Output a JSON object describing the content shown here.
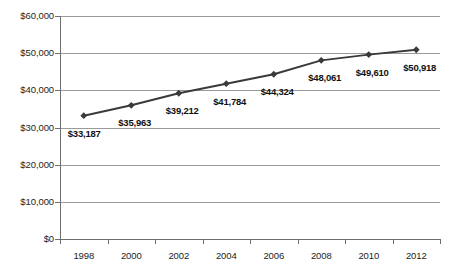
{
  "chart_data": {
    "type": "line",
    "title": "",
    "subtitle": "",
    "xlabel": "",
    "ylabel": "",
    "categories": [
      "1998",
      "2000",
      "2002",
      "2004",
      "2006",
      "2008",
      "2010",
      "2012"
    ],
    "values": [
      33187,
      35963,
      39212,
      41784,
      44324,
      48061,
      49610,
      50918
    ],
    "point_labels": [
      "$33,187",
      "$35,963",
      "$39,212",
      "$41,784",
      "$44,324",
      "$48,061",
      "$49,610",
      "$50,918"
    ],
    "series": [
      {
        "name": "",
        "values": [
          33187,
          35963,
          39212,
          41784,
          44324,
          48061,
          49610,
          50918
        ],
        "color": "#3a3a3a",
        "marker": "diamond"
      }
    ],
    "ylim": [
      0,
      60000
    ],
    "ytick_values": [
      0,
      10000,
      20000,
      30000,
      40000,
      50000,
      60000
    ],
    "ytick_labels": [
      "$0",
      "$10,000",
      "$20,000",
      "$30,000",
      "$40,000",
      "$50,000",
      "$60,000"
    ],
    "grid": true,
    "grid_axis": "y",
    "legend": false,
    "legend_position": "none",
    "annotations": []
  },
  "colors": {
    "series_line": "#3a3a3a",
    "marker": "#3a3a3a",
    "gridline": "#9a9a9a",
    "axis": "#6e6e6e",
    "text": "#1d1d1d",
    "background": "#ffffff"
  }
}
